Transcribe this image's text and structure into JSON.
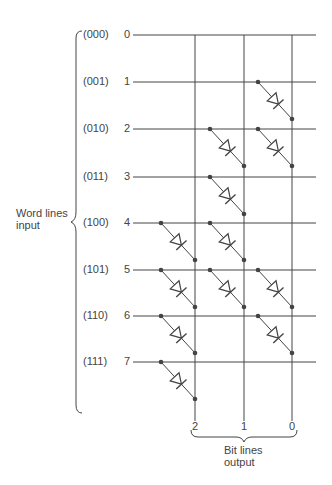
{
  "word_lines": {
    "label_line1": "Word lines",
    "label_line2": "input",
    "rows": [
      {
        "index": "0",
        "code": "(000)",
        "diodes": []
      },
      {
        "index": "1",
        "code": "(001)",
        "diodes": [
          0
        ]
      },
      {
        "index": "2",
        "code": "(010)",
        "diodes": [
          1,
          0
        ]
      },
      {
        "index": "3",
        "code": "(011)",
        "diodes": [
          1
        ]
      },
      {
        "index": "4",
        "code": "(100)",
        "diodes": [
          2,
          1
        ]
      },
      {
        "index": "5",
        "code": "(101)",
        "diodes": [
          2,
          1,
          0
        ]
      },
      {
        "index": "6",
        "code": "(110)",
        "diodes": [
          2,
          0
        ]
      },
      {
        "index": "7",
        "code": "(111)",
        "diodes": [
          2
        ]
      }
    ]
  },
  "bit_lines": {
    "label_line1": "Bit lines",
    "label_line2": "output",
    "columns": [
      {
        "index": "2"
      },
      {
        "index": "1"
      },
      {
        "index": "0"
      }
    ]
  },
  "colors": {
    "line": "#444444",
    "text": "#444444"
  }
}
